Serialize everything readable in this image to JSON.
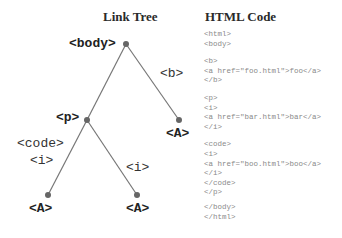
{
  "titles": {
    "tree": "Link Tree",
    "code": "HTML Code"
  },
  "tree": {
    "nodes": {
      "body": {
        "label": "<body>",
        "x": 126,
        "y": 44
      },
      "p": {
        "label": "<p>",
        "x": 87,
        "y": 120
      },
      "a_right": {
        "label": "<A>",
        "x": 179,
        "y": 120
      },
      "a_left": {
        "label": "<A>",
        "x": 48,
        "y": 195
      },
      "a_mid": {
        "label": "<A>",
        "x": 137,
        "y": 195
      }
    },
    "edges": {
      "b": "<b>",
      "code": "<code>",
      "i_left": "<i>",
      "i_right": "<i>"
    },
    "line_color": "#777777",
    "node_color": "#666666"
  },
  "code": {
    "block_open": [
      "<html>",
      "<body>"
    ],
    "block_b": [
      "<b>",
      "<a href=\"foo.html\">foo</a>",
      "</b>"
    ],
    "block_p": [
      "<p>",
      "<i>",
      "<a href=\"bar.html\">bar</a>",
      "</i>"
    ],
    "block_code": [
      "<code>",
      "<i>",
      "<a href=\"boo.html\">boo</a>",
      "</i>",
      "</code>",
      "</p>"
    ],
    "block_close": [
      "</body>",
      "</html>"
    ]
  }
}
